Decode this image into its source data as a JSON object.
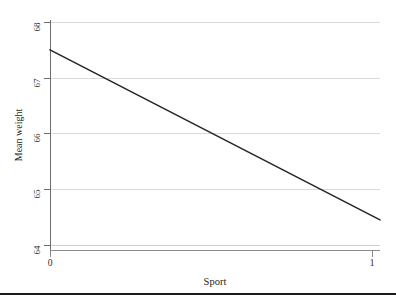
{
  "chart_data": {
    "type": "line",
    "title": "",
    "subtitle": "",
    "xlabel": "Sport",
    "ylabel": "Mean weight",
    "x": [
      0,
      1
    ],
    "series": [
      {
        "name": "Mean weight",
        "values": [
          67.5,
          64.45
        ],
        "color": "#262626"
      }
    ],
    "xlim": [
      0,
      1
    ],
    "ylim": [
      64,
      68
    ],
    "xticks": [
      0,
      1
    ],
    "xticklabels": [
      "0",
      "1"
    ],
    "yticks": [
      64,
      65,
      66,
      67,
      68
    ],
    "yticklabels": [
      "64",
      "65",
      "66",
      "67",
      "68"
    ],
    "grid": "horizontal",
    "legend": "none",
    "gridline_color": "#d9d9d9",
    "axis_color": "#6e6e6e"
  },
  "figure": {
    "y_axis_title": "Mean weight",
    "x_axis_title": "Sport",
    "y_tick_labels": [
      "68",
      "67",
      "66",
      "65",
      "64"
    ],
    "x_tick_labels": [
      "0",
      "1"
    ]
  }
}
